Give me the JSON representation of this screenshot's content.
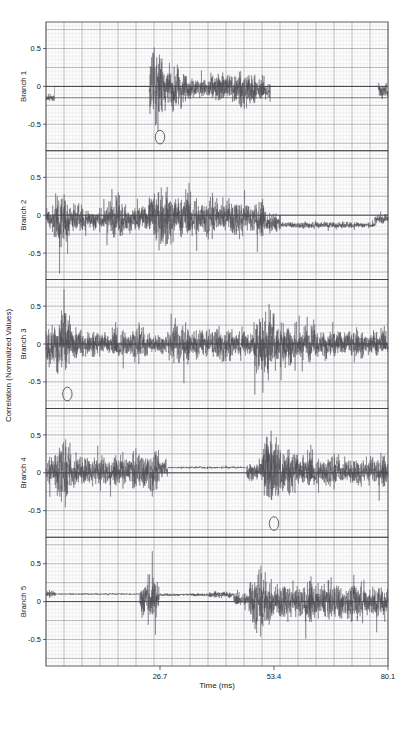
{
  "figure": {
    "xlabel": "Time (ms)",
    "ylabel": "Correlation (Normalized Values)",
    "xticks": [
      "26.7",
      "53.4",
      "80.1"
    ],
    "yticks": [
      "0.5",
      "0",
      "-0.5"
    ],
    "grid": "on",
    "bg_color": "#ffffff",
    "trace_color": "#4a4a52",
    "grid_minor_color": "#d8d8dc",
    "grid_major_color": "#8e8e96",
    "axis_color": "#2b2b2b",
    "annotation_color": "#3c3c44"
  },
  "chart_data": {
    "type": "line",
    "title": "",
    "xlabel": "Time (ms)",
    "ylabel": "Correlation (Normalized Values)",
    "xlim": [
      0,
      80.1
    ],
    "ylim": [
      -0.85,
      0.85
    ],
    "xticks": [
      26.7,
      53.4,
      80.1
    ],
    "yticks": [
      -0.5,
      0,
      0.5
    ],
    "grid": true,
    "legend": "none",
    "panels": [
      {
        "name": "Branch 1",
        "label": "Branch 1",
        "baseline": 0,
        "annotation": {
          "type": "ellipse",
          "x": 26.7,
          "y": -0.67,
          "rx": 1.1,
          "ry": 0.09
        },
        "bursts": [
          {
            "x0": 0.0,
            "x1": 2.0,
            "amp": 0.06,
            "dc": -0.15
          },
          {
            "x0": 24.2,
            "x1": 28.0,
            "amp": 0.58,
            "dc": -0.02
          },
          {
            "x0": 28.0,
            "x1": 33.0,
            "amp": 0.3,
            "dc": -0.02
          },
          {
            "x0": 33.0,
            "x1": 37.5,
            "amp": 0.17,
            "dc": -0.03
          },
          {
            "x0": 37.5,
            "x1": 44.0,
            "amp": 0.24,
            "dc": -0.02
          },
          {
            "x0": 44.0,
            "x1": 49.5,
            "amp": 0.28,
            "dc": -0.04
          },
          {
            "x0": 49.5,
            "x1": 52.5,
            "amp": 0.16,
            "dc": -0.06
          },
          {
            "x0": 77.8,
            "x1": 80.1,
            "amp": 0.12,
            "dc": -0.05
          }
        ],
        "flatline": {
          "level": -0.15,
          "from": 0.0,
          "to": 80.1
        }
      },
      {
        "name": "Branch 2",
        "label": "Branch 2",
        "baseline": 0,
        "annotation": null,
        "bursts": [
          {
            "x0": 0.0,
            "x1": 1.5,
            "amp": 0.14,
            "dc": -0.05
          },
          {
            "x0": 1.5,
            "x1": 5.5,
            "amp": 0.46,
            "dc": -0.06
          },
          {
            "x0": 5.5,
            "x1": 9.5,
            "amp": 0.22,
            "dc": -0.05
          },
          {
            "x0": 9.5,
            "x1": 14.0,
            "amp": 0.17,
            "dc": -0.05
          },
          {
            "x0": 14.0,
            "x1": 19.0,
            "amp": 0.3,
            "dc": -0.05
          },
          {
            "x0": 19.0,
            "x1": 24.0,
            "amp": 0.22,
            "dc": -0.05
          },
          {
            "x0": 24.0,
            "x1": 30.5,
            "amp": 0.44,
            "dc": -0.03
          },
          {
            "x0": 30.5,
            "x1": 36.0,
            "amp": 0.34,
            "dc": -0.03
          },
          {
            "x0": 36.0,
            "x1": 41.0,
            "amp": 0.27,
            "dc": -0.02
          },
          {
            "x0": 41.0,
            "x1": 47.5,
            "amp": 0.3,
            "dc": -0.02
          },
          {
            "x0": 47.5,
            "x1": 51.5,
            "amp": 0.26,
            "dc": -0.06
          },
          {
            "x0": 51.5,
            "x1": 55.0,
            "amp": 0.14,
            "dc": -0.1
          },
          {
            "x0": 55.0,
            "x1": 77.0,
            "amp": 0.05,
            "dc": -0.13
          },
          {
            "x0": 77.0,
            "x1": 80.1,
            "amp": 0.07,
            "dc": -0.05
          }
        ],
        "flatline": null
      },
      {
        "name": "Branch 3",
        "label": "Branch 3",
        "baseline": 0,
        "annotation": {
          "type": "ellipse",
          "x": 5.0,
          "y": -0.66,
          "rx": 1.1,
          "ry": 0.09
        },
        "bursts": [
          {
            "x0": 0.0,
            "x1": 2.4,
            "amp": 0.34,
            "dc": 0.0
          },
          {
            "x0": 2.4,
            "x1": 5.8,
            "amp": 0.6,
            "dc": 0.0
          },
          {
            "x0": 5.8,
            "x1": 9.0,
            "amp": 0.26,
            "dc": 0.0
          },
          {
            "x0": 9.0,
            "x1": 14.5,
            "amp": 0.19,
            "dc": 0.0
          },
          {
            "x0": 14.5,
            "x1": 19.5,
            "amp": 0.22,
            "dc": 0.0
          },
          {
            "x0": 19.5,
            "x1": 24.0,
            "amp": 0.24,
            "dc": 0.0
          },
          {
            "x0": 24.0,
            "x1": 28.5,
            "amp": 0.16,
            "dc": 0.0
          },
          {
            "x0": 28.5,
            "x1": 33.5,
            "amp": 0.34,
            "dc": 0.0
          },
          {
            "x0": 33.5,
            "x1": 38.5,
            "amp": 0.2,
            "dc": 0.0
          },
          {
            "x0": 38.5,
            "x1": 44.0,
            "amp": 0.26,
            "dc": 0.0
          },
          {
            "x0": 44.0,
            "x1": 48.5,
            "amp": 0.21,
            "dc": 0.0
          },
          {
            "x0": 48.5,
            "x1": 54.0,
            "amp": 0.55,
            "dc": 0.0
          },
          {
            "x0": 54.0,
            "x1": 59.0,
            "amp": 0.38,
            "dc": 0.0
          },
          {
            "x0": 59.0,
            "x1": 64.0,
            "amp": 0.26,
            "dc": 0.0
          },
          {
            "x0": 64.0,
            "x1": 69.5,
            "amp": 0.24,
            "dc": 0.0
          },
          {
            "x0": 69.5,
            "x1": 75.0,
            "amp": 0.22,
            "dc": 0.0
          },
          {
            "x0": 75.0,
            "x1": 80.1,
            "amp": 0.2,
            "dc": 0.0
          }
        ],
        "flatline": null
      },
      {
        "name": "Branch 4",
        "label": "Branch 4",
        "baseline": 0,
        "annotation": {
          "type": "ellipse",
          "x": 53.4,
          "y": -0.67,
          "rx": 1.1,
          "ry": 0.09
        },
        "bursts": [
          {
            "x0": 0.0,
            "x1": 2.0,
            "amp": 0.22,
            "dc": 0.02
          },
          {
            "x0": 2.0,
            "x1": 6.0,
            "amp": 0.44,
            "dc": 0.02
          },
          {
            "x0": 6.0,
            "x1": 10.5,
            "amp": 0.26,
            "dc": 0.02
          },
          {
            "x0": 10.5,
            "x1": 15.5,
            "amp": 0.26,
            "dc": 0.02
          },
          {
            "x0": 15.5,
            "x1": 19.5,
            "amp": 0.22,
            "dc": 0.02
          },
          {
            "x0": 19.5,
            "x1": 23.5,
            "amp": 0.28,
            "dc": 0.02
          },
          {
            "x0": 23.5,
            "x1": 26.5,
            "amp": 0.34,
            "dc": 0.02
          },
          {
            "x0": 26.5,
            "x1": 28.5,
            "amp": 0.14,
            "dc": 0.06
          },
          {
            "x0": 28.5,
            "x1": 47.0,
            "amp": 0.015,
            "dc": 0.07
          },
          {
            "x0": 47.0,
            "x1": 50.5,
            "amp": 0.16,
            "dc": 0.02
          },
          {
            "x0": 50.5,
            "x1": 55.0,
            "amp": 0.62,
            "dc": 0.02
          },
          {
            "x0": 55.0,
            "x1": 59.5,
            "amp": 0.34,
            "dc": 0.02
          },
          {
            "x0": 59.5,
            "x1": 64.0,
            "amp": 0.26,
            "dc": 0.02
          },
          {
            "x0": 64.0,
            "x1": 69.5,
            "amp": 0.22,
            "dc": 0.02
          },
          {
            "x0": 69.5,
            "x1": 75.0,
            "amp": 0.22,
            "dc": 0.02
          },
          {
            "x0": 75.0,
            "x1": 80.1,
            "amp": 0.24,
            "dc": 0.02
          }
        ],
        "flatline": null
      },
      {
        "name": "Branch 5",
        "label": "Branch 5",
        "baseline": 0,
        "annotation": null,
        "bursts": [
          {
            "x0": 0.0,
            "x1": 2.2,
            "amp": 0.05,
            "dc": 0.1
          },
          {
            "x0": 2.2,
            "x1": 22.0,
            "amp": 0.012,
            "dc": 0.1
          },
          {
            "x0": 22.0,
            "x1": 26.5,
            "amp": 0.34,
            "dc": 0.03
          },
          {
            "x0": 26.5,
            "x1": 33.0,
            "amp": 0.02,
            "dc": 0.09
          },
          {
            "x0": 33.0,
            "x1": 38.0,
            "amp": 0.025,
            "dc": 0.09
          },
          {
            "x0": 38.0,
            "x1": 44.0,
            "amp": 0.05,
            "dc": 0.09
          },
          {
            "x0": 44.0,
            "x1": 47.5,
            "amp": 0.1,
            "dc": 0.03
          },
          {
            "x0": 47.5,
            "x1": 53.0,
            "amp": 0.42,
            "dc": 0.0
          },
          {
            "x0": 53.0,
            "x1": 58.0,
            "amp": 0.3,
            "dc": 0.0
          },
          {
            "x0": 58.0,
            "x1": 64.0,
            "amp": 0.3,
            "dc": 0.0
          },
          {
            "x0": 64.0,
            "x1": 70.0,
            "amp": 0.28,
            "dc": 0.0
          },
          {
            "x0": 70.0,
            "x1": 75.0,
            "amp": 0.3,
            "dc": 0.0
          },
          {
            "x0": 75.0,
            "x1": 80.1,
            "amp": 0.26,
            "dc": 0.0
          }
        ],
        "flatline": null
      }
    ]
  },
  "layout": {
    "plot_left": 46,
    "plot_right": 388,
    "plot_top": 22,
    "plot_bottom": 666,
    "panel_count": 5
  }
}
